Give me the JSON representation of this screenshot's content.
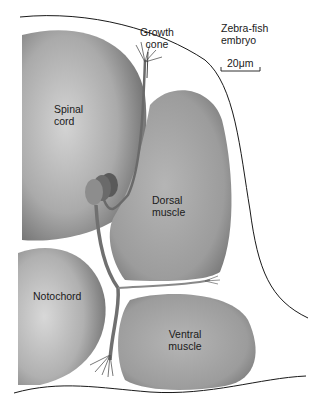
{
  "labels": {
    "growth_cone_line1": "Growth",
    "growth_cone_line2": "cone",
    "organism_line1": "Zebra-fish",
    "organism_line2": "embryo",
    "scale_bar": "20μm",
    "spinal_cord_line1": "Spinal",
    "spinal_cord_line2": "cord",
    "dorsal_muscle_line1": "Dorsal",
    "dorsal_muscle_line2": "muscle",
    "notochord": "Notochord",
    "ventral_muscle_line1": "Ventral",
    "ventral_muscle_line2": "muscle"
  },
  "colors": {
    "tissue_fill": "#9a9a9a",
    "tissue_highlight": "#d0d0d0",
    "neuron_fill": "#6f6f6f",
    "outline": "#1a1a1a",
    "background": "#ffffff"
  }
}
